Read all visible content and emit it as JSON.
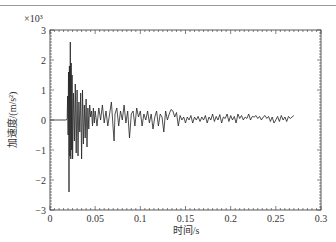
{
  "chart_data": {
    "type": "line",
    "title": "",
    "xlabel": "时间/s",
    "ylabel": "加速度/(m/s²)",
    "y_multiplier": "×10³",
    "xlim": [
      0,
      0.3
    ],
    "ylim": [
      -3,
      3
    ],
    "grid": false,
    "legend": null,
    "x_ticks": [
      0,
      0.05,
      0.1,
      0.15,
      0.2,
      0.25,
      0.3
    ],
    "x_tick_labels": [
      "0",
      "0.05",
      "0.1",
      "0.15",
      "0.2",
      "0.25",
      "0.3"
    ],
    "y_ticks": [
      -3,
      -2,
      -1,
      0,
      1,
      2,
      3
    ],
    "y_tick_labels": [
      "−3",
      "−2",
      "−1",
      "0",
      "1",
      "2",
      "3"
    ],
    "series": [
      {
        "name": "acceleration",
        "color": "#222222",
        "points": [
          [
            0.0,
            0.0
          ],
          [
            0.01,
            0.0
          ],
          [
            0.018,
            0.0
          ],
          [
            0.019,
            0.05
          ],
          [
            0.0195,
            0.8
          ],
          [
            0.02,
            -0.5
          ],
          [
            0.0205,
            1.6
          ],
          [
            0.021,
            -2.4
          ],
          [
            0.0215,
            1.8
          ],
          [
            0.022,
            -1.2
          ],
          [
            0.0225,
            2.6
          ],
          [
            0.023,
            -1.3
          ],
          [
            0.0235,
            1.9
          ],
          [
            0.024,
            -1.0
          ],
          [
            0.0245,
            1.5
          ],
          [
            0.025,
            -1.3
          ],
          [
            0.026,
            0.9
          ],
          [
            0.027,
            -0.7
          ],
          [
            0.028,
            1.2
          ],
          [
            0.029,
            -1.1
          ],
          [
            0.03,
            1.0
          ],
          [
            0.031,
            -1.2
          ],
          [
            0.032,
            0.6
          ],
          [
            0.033,
            -0.4
          ],
          [
            0.034,
            0.9
          ],
          [
            0.035,
            -1.3
          ],
          [
            0.036,
            1.0
          ],
          [
            0.037,
            -0.8
          ],
          [
            0.038,
            0.5
          ],
          [
            0.039,
            -0.6
          ],
          [
            0.04,
            0.7
          ],
          [
            0.041,
            -0.9
          ],
          [
            0.042,
            0.4
          ],
          [
            0.043,
            -0.3
          ],
          [
            0.044,
            0.5
          ],
          [
            0.045,
            0.1
          ],
          [
            0.046,
            0.3
          ],
          [
            0.047,
            -0.2
          ],
          [
            0.048,
            0.4
          ],
          [
            0.049,
            -0.1
          ],
          [
            0.05,
            0.3
          ],
          [
            0.052,
            -0.2
          ],
          [
            0.054,
            0.4
          ],
          [
            0.056,
            0.0
          ],
          [
            0.058,
            0.5
          ],
          [
            0.06,
            -0.1
          ],
          [
            0.062,
            0.3
          ],
          [
            0.064,
            -0.2
          ],
          [
            0.066,
            0.2
          ],
          [
            0.068,
            0.6
          ],
          [
            0.07,
            -0.3
          ],
          [
            0.071,
            -0.7
          ],
          [
            0.072,
            0.2
          ],
          [
            0.074,
            0.4
          ],
          [
            0.076,
            -0.2
          ],
          [
            0.078,
            0.3
          ],
          [
            0.08,
            0.0
          ],
          [
            0.082,
            0.5
          ],
          [
            0.084,
            -0.1
          ],
          [
            0.086,
            0.3
          ],
          [
            0.088,
            -0.6
          ],
          [
            0.09,
            0.2
          ],
          [
            0.092,
            0.3
          ],
          [
            0.094,
            -0.2
          ],
          [
            0.096,
            0.4
          ],
          [
            0.098,
            0.1
          ],
          [
            0.1,
            0.3
          ],
          [
            0.102,
            -0.2
          ],
          [
            0.104,
            0.2
          ],
          [
            0.106,
            0.0
          ],
          [
            0.108,
            0.3
          ],
          [
            0.11,
            -0.1
          ],
          [
            0.112,
            0.2
          ],
          [
            0.114,
            -0.3
          ],
          [
            0.116,
            0.1
          ],
          [
            0.118,
            0.3
          ],
          [
            0.12,
            -0.2
          ],
          [
            0.122,
            0.2
          ],
          [
            0.124,
            0.1
          ],
          [
            0.126,
            -0.4
          ],
          [
            0.128,
            0.3
          ],
          [
            0.13,
            0.0
          ],
          [
            0.132,
            0.2
          ],
          [
            0.134,
            0.35
          ],
          [
            0.136,
            0.3
          ],
          [
            0.138,
            0.1
          ],
          [
            0.14,
            0.25
          ],
          [
            0.142,
            -0.2
          ],
          [
            0.144,
            0.15
          ],
          [
            0.146,
            0.0
          ],
          [
            0.148,
            0.1
          ],
          [
            0.15,
            -0.1
          ],
          [
            0.152,
            0.1
          ],
          [
            0.154,
            0.0
          ],
          [
            0.156,
            0.15
          ],
          [
            0.158,
            -0.1
          ],
          [
            0.16,
            0.1
          ],
          [
            0.162,
            0.0
          ],
          [
            0.164,
            0.12
          ],
          [
            0.166,
            -0.05
          ],
          [
            0.168,
            0.1
          ],
          [
            0.17,
            0.0
          ],
          [
            0.172,
            0.15
          ],
          [
            0.174,
            -0.1
          ],
          [
            0.176,
            0.1
          ],
          [
            0.178,
            0.0
          ],
          [
            0.18,
            0.2
          ],
          [
            0.182,
            -0.05
          ],
          [
            0.184,
            0.12
          ],
          [
            0.186,
            0.0
          ],
          [
            0.188,
            0.18
          ],
          [
            0.19,
            -0.1
          ],
          [
            0.192,
            0.1
          ],
          [
            0.194,
            0.05
          ],
          [
            0.196,
            0.2
          ],
          [
            0.198,
            -0.05
          ],
          [
            0.2,
            0.15
          ],
          [
            0.202,
            0.0
          ],
          [
            0.204,
            0.12
          ],
          [
            0.206,
            -0.1
          ],
          [
            0.208,
            0.2
          ],
          [
            0.21,
            0.05
          ],
          [
            0.212,
            0.15
          ],
          [
            0.214,
            0.0
          ],
          [
            0.216,
            0.1
          ],
          [
            0.218,
            0.05
          ],
          [
            0.22,
            0.2
          ],
          [
            0.222,
            0.0
          ],
          [
            0.224,
            0.12
          ],
          [
            0.226,
            0.1
          ],
          [
            0.228,
            0.15
          ],
          [
            0.23,
            0.05
          ],
          [
            0.232,
            0.12
          ],
          [
            0.234,
            0.0
          ],
          [
            0.236,
            0.1
          ],
          [
            0.238,
            0.15
          ],
          [
            0.24,
            0.05
          ],
          [
            0.242,
            0.12
          ],
          [
            0.244,
            -0.05
          ],
          [
            0.246,
            0.1
          ],
          [
            0.248,
            -0.1
          ],
          [
            0.25,
            0.0
          ],
          [
            0.252,
            0.12
          ],
          [
            0.254,
            -0.05
          ],
          [
            0.256,
            0.15
          ],
          [
            0.258,
            0.0
          ],
          [
            0.26,
            0.1
          ],
          [
            0.262,
            -0.05
          ],
          [
            0.264,
            0.12
          ],
          [
            0.266,
            0.05
          ],
          [
            0.268,
            0.1
          ],
          [
            0.27,
            0.15
          ]
        ]
      }
    ]
  },
  "layout": {
    "plot_left": 50,
    "plot_top": 30,
    "plot_right": 321,
    "plot_bottom": 210
  }
}
